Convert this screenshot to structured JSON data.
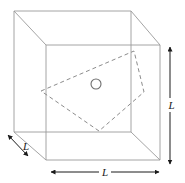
{
  "figure": {
    "background_color": "#ffffff",
    "solid_line_color": "#8c8c8c",
    "dashed_line_color": "#8c8c8c",
    "arrow_color": "#1a1a1a",
    "circle_color": "#6e6e6e",
    "labels": {
      "width": "L",
      "height": "L",
      "depth": "L"
    },
    "geometry": {
      "cube": {
        "front_face": {
          "top_left": [
            46,
            45
          ],
          "top_right": [
            160,
            45
          ],
          "bottom_right": [
            160,
            160
          ],
          "bottom_left": [
            46,
            160
          ]
        },
        "back_face": {
          "top_left": [
            14,
            11
          ],
          "top_right": [
            131,
            11
          ],
          "bottom_right": [
            131,
            132
          ],
          "bottom_left": [
            14,
            132
          ]
        }
      },
      "dashed_quad": {
        "vertices": [
          [
            41,
            91
          ],
          [
            134,
            51
          ],
          [
            144,
            92
          ],
          [
            99,
            131
          ]
        ]
      },
      "circle": {
        "center": [
          96,
          84
        ],
        "radius": 5
      },
      "dimension_arrows": {
        "height_right": {
          "x": 170,
          "y_start": 46,
          "y_end": 165
        },
        "width_bottom": {
          "y": 172,
          "x_start": 50,
          "x_end": 160
        },
        "depth_diagonal": {
          "start": [
            7,
            134
          ],
          "end": [
            29,
            157
          ]
        }
      }
    }
  }
}
